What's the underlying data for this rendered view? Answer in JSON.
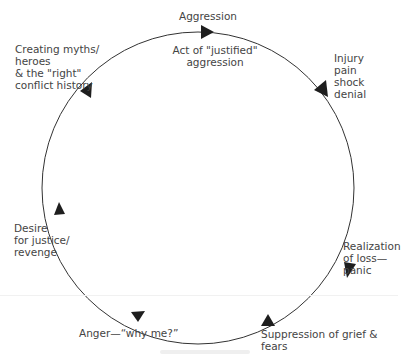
{
  "diagram": {
    "stages": [
      {
        "id": "aggression",
        "label": "Aggression"
      },
      {
        "id": "act",
        "label": "Act of \"justified\"\naggression"
      },
      {
        "id": "injury",
        "label": "Injury\npain\nshock\ndenial"
      },
      {
        "id": "realization",
        "label": "Realization\nof loss—\npanic"
      },
      {
        "id": "suppression",
        "label": "Suppression of grief & fears"
      },
      {
        "id": "anger",
        "label": "Anger—“why me?”"
      },
      {
        "id": "desire",
        "label": "Desire\nfor justice/\nrevenge"
      },
      {
        "id": "myths",
        "label": "Creating myths/\nheroes\n& the \"right\"\nconflict history"
      }
    ],
    "flow_direction": "clockwise",
    "colors": {
      "line": "#333333",
      "arrow": "#1e1e1e",
      "text": "#444444"
    }
  }
}
